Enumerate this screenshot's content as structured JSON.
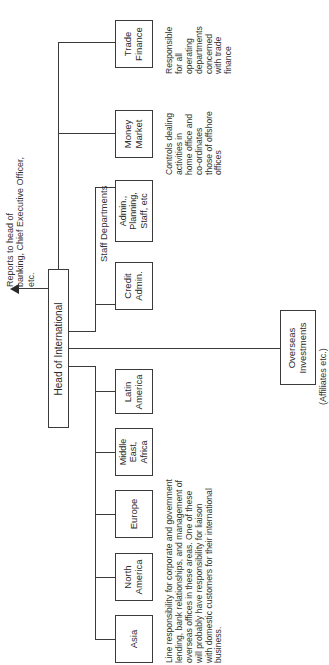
{
  "diagram": {
    "type": "organization-chart",
    "orientation": "rotated-90-ccw",
    "reports_to": "Reports to head of\nbanking, Chief Executive Officer,\netc.",
    "head": "Head of International",
    "staff_label": "Staff Departments",
    "nodes": {
      "trade_finance": "Trade\nFinance",
      "money_market": "Money\nMarket",
      "admin_planning": "Admin.,\nPlanning,\nStaff, etc",
      "credit_admin": "Credit\nAdmin.",
      "latin_america": "Latin\nAmerica",
      "middle_east_africa": "Middle\nEast,\nAfrica",
      "europe": "Europe",
      "north_america": "North\nAmerica",
      "asia": "Asia",
      "overseas_investments": "Overseas\nInvestments"
    },
    "notes": {
      "trade_finance": "Responsible\nfor all\noperating\ndepartments\nconcerned\nwith trade\nfinance",
      "money_market": "Controls dealing\nactivities in\nhome office and\nco-ordinates\nthose of offshore\noffices",
      "regions": "Line responsibility for corporate and government\nlending, bank relationships, and management of\noverseas offices in these areas. One of these\nwill probably have responsibility for liaison\nwith domestic customers for their international\nbusiness.",
      "overseas": "(Affiliates etc.)"
    },
    "colors": {
      "line": "#3a3a3a",
      "text": "#2a2a2a",
      "background": "#ffffff"
    }
  }
}
